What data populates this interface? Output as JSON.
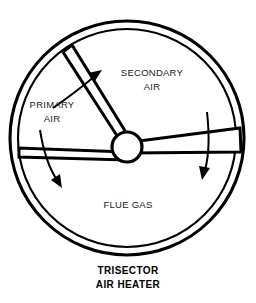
{
  "figure": {
    "name": "trisector-air-heater-cross-section",
    "caption_line1": "TRISECTOR",
    "caption_line2": "AIR HEATER",
    "sectors": [
      {
        "id": "primary-air",
        "label_line1": "PRIMARY",
        "label_line2": "AIR",
        "label_x": 52,
        "label_y": 108,
        "flow_direction": "outward"
      },
      {
        "id": "secondary-air",
        "label_line1": "SECONDARY",
        "label_line2": "AIR",
        "label_x": 152,
        "label_y": 76,
        "flow_direction": "outward"
      },
      {
        "id": "flue-gas",
        "label_line1": "FLUE GAS",
        "label_line2": "",
        "label_x": 128,
        "label_y": 208,
        "flow_direction": "outward"
      }
    ],
    "arrows": [
      {
        "id": "primary-air-flow-arrow",
        "direction": "up-right"
      },
      {
        "id": "flue-gas-left-flow-arrow",
        "direction": "down-left"
      },
      {
        "id": "flue-gas-right-flow-arrow",
        "direction": "down"
      }
    ],
    "geometry": {
      "shell_center_x": 127,
      "shell_center_y": 138,
      "shell_outer_radius": 117,
      "shell_inner_radius": 110,
      "hub_center_x": 127,
      "hub_center_y": 147,
      "hub_radius": 15
    },
    "colors": {
      "stroke": "#000000",
      "background": "#ffffff",
      "label_text": "#1a1a1a"
    }
  }
}
